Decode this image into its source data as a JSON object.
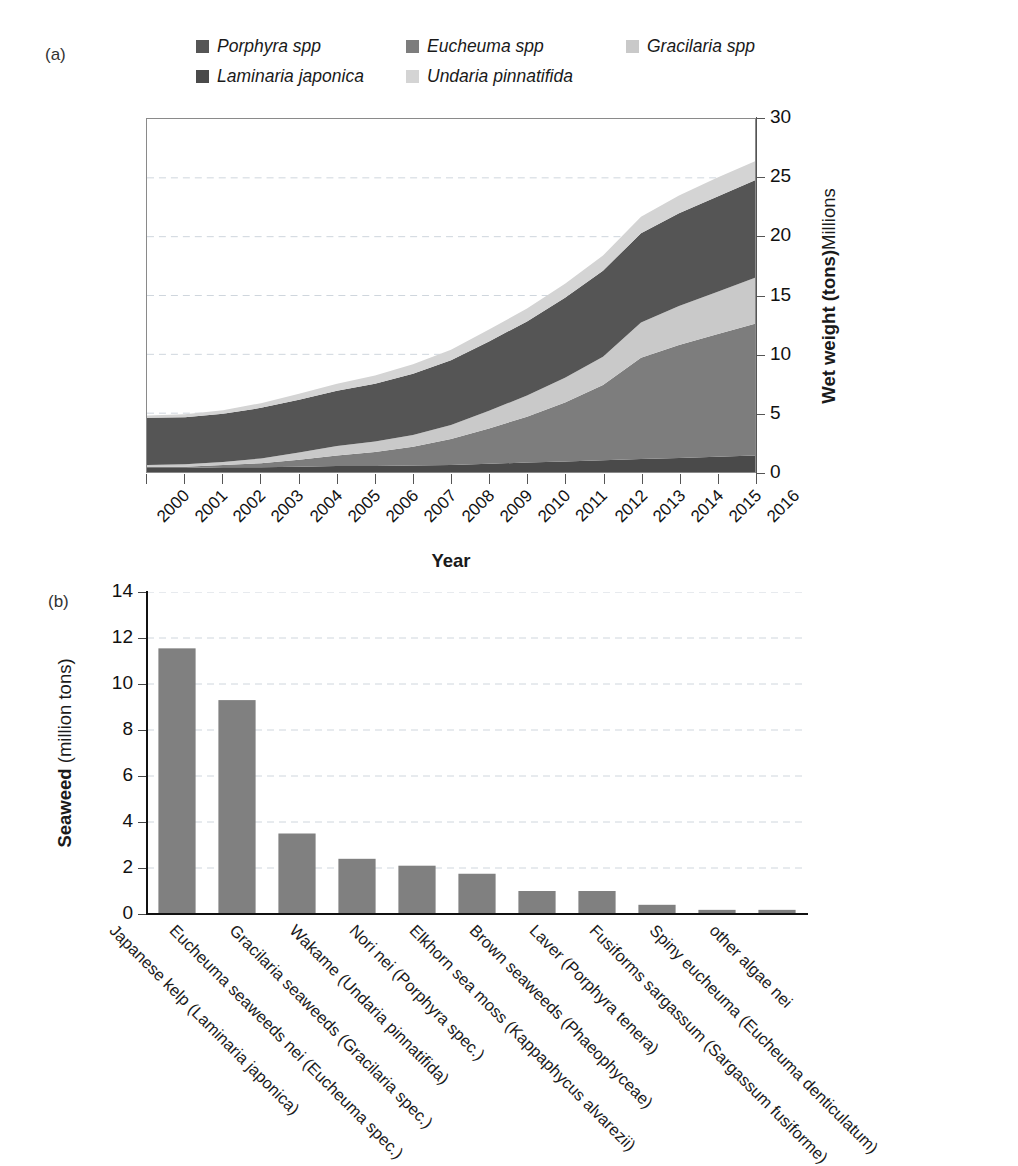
{
  "panels": {
    "a_tag": "(a)",
    "b_tag": "(b)"
  },
  "legend": {
    "rows": [
      [
        {
          "label": "Porphyra spp",
          "color": "#555555"
        },
        {
          "label": "Eucheuma spp",
          "color": "#7d7d7d"
        },
        {
          "label": "Gracilaria spp",
          "color": "#c9c9c9"
        }
      ],
      [
        {
          "label": "Laminaria japonica",
          "color": "#4a4a4a"
        },
        {
          "label": "Undaria pinnatifida",
          "color": "#d4d4d4"
        }
      ]
    ]
  },
  "chart_data": [
    {
      "type": "area",
      "panel": "(a)",
      "title": "",
      "xlabel": "Year",
      "ylabel": "Wet weight (tons)",
      "ylabel_suffix": "Millions",
      "ylim": [
        0,
        30
      ],
      "yticks": [
        0,
        5,
        10,
        15,
        20,
        25,
        30
      ],
      "grid": true,
      "legend_position": "top",
      "x": [
        2000,
        2001,
        2002,
        2003,
        2004,
        2005,
        2006,
        2007,
        2008,
        2009,
        2010,
        2011,
        2012,
        2013,
        2014,
        2015,
        2016
      ],
      "stack_order_bottom_to_top": [
        "Laminaria japonica",
        "Eucheuma spp",
        "Gracilaria spp",
        "Porphyra spp",
        "Undaria pinnatifida"
      ],
      "series": [
        {
          "name": "Laminaria japonica",
          "color": "#4a4a4a",
          "values": [
            0.35,
            0.35,
            0.4,
            0.4,
            0.45,
            0.5,
            0.5,
            0.55,
            0.6,
            0.7,
            0.8,
            0.9,
            1.0,
            1.1,
            1.2,
            1.3,
            1.4
          ]
        },
        {
          "name": "Eucheuma spp",
          "color": "#7d7d7d",
          "values": [
            0.1,
            0.1,
            0.2,
            0.35,
            0.6,
            0.9,
            1.2,
            1.6,
            2.2,
            3.0,
            3.9,
            5.0,
            6.4,
            8.6,
            9.6,
            10.4,
            11.2
          ]
        },
        {
          "name": "Gracilaria spp",
          "color": "#c9c9c9",
          "values": [
            0.15,
            0.2,
            0.25,
            0.4,
            0.6,
            0.8,
            0.9,
            1.0,
            1.2,
            1.5,
            1.8,
            2.1,
            2.4,
            3.0,
            3.3,
            3.6,
            3.9
          ]
        },
        {
          "name": "Porphyra spp",
          "color": "#555555",
          "values": [
            4.0,
            4.0,
            4.1,
            4.3,
            4.5,
            4.7,
            4.9,
            5.2,
            5.5,
            5.9,
            6.3,
            6.8,
            7.3,
            7.6,
            7.9,
            8.1,
            8.3
          ]
        },
        {
          "name": "Undaria pinnatifida",
          "color": "#d4d4d4",
          "values": [
            0.2,
            0.25,
            0.3,
            0.4,
            0.5,
            0.6,
            0.7,
            0.8,
            0.9,
            1.0,
            1.1,
            1.2,
            1.3,
            1.4,
            1.5,
            1.6,
            1.6
          ]
        }
      ],
      "totals": [
        4.8,
        4.9,
        5.25,
        5.85,
        6.65,
        7.5,
        8.2,
        9.15,
        10.4,
        12.1,
        13.9,
        16.0,
        18.4,
        21.7,
        23.5,
        25.0,
        26.4
      ]
    },
    {
      "type": "bar",
      "panel": "(b)",
      "title": "",
      "xlabel": "",
      "ylabel": "Seaweed",
      "ylabel_suffix": "(million tons)",
      "ylim": [
        0,
        14
      ],
      "yticks": [
        0,
        2,
        4,
        6,
        8,
        10,
        12,
        14
      ],
      "grid": true,
      "bar_color": "#808080",
      "categories": [
        "Japanese kelp (Laminaria japonica)",
        "Eucheuma seaweeds nei (Eucheuma spec.)",
        "Gracilaria seaweeds (Gracilaria spec.)",
        "Wakame (Undaria pinnatifida)",
        "Nori nei (Porphyra spec.)",
        "Elkhorn sea moss (Kappaphycus alvarezii)",
        "Brown seaweeds (Phaeophyceae)",
        "Laver (Porphyra tenera)",
        "Fusiforms sargassum (Sargassum fusiforme)",
        "Spiny eucheuma (Eucheuma denticulatum)",
        "other algae nei"
      ],
      "values": [
        11.55,
        9.3,
        3.5,
        2.4,
        2.1,
        1.75,
        1.0,
        1.0,
        0.4,
        0.18,
        0.18
      ]
    }
  ]
}
